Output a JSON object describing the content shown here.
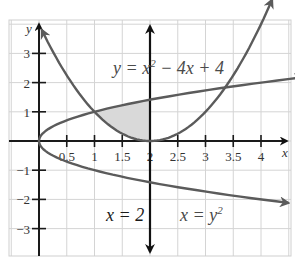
{
  "chart_data": {
    "type": "line",
    "title": "",
    "xlabel": "x",
    "ylabel": "y",
    "xlim": [
      -0.55,
      4.55
    ],
    "ylim": [
      -3.9,
      4.2
    ],
    "grid": true,
    "x_ticks": [
      0.5,
      1,
      1.5,
      2,
      2.5,
      3,
      3.5,
      4
    ],
    "x_tick_labels": [
      "0.5",
      "1",
      "1.5",
      "2",
      "2.5",
      "3",
      "3.5",
      "4"
    ],
    "y_ticks": [
      3,
      2,
      1,
      -1,
      -2,
      -3
    ],
    "y_tick_labels": [
      "3",
      "2",
      "1",
      "−1",
      "−2",
      "−3"
    ],
    "series": [
      {
        "name": "y = x^2 − 4x + 4",
        "kind": "function_of_x",
        "expression": "(x-2)^2",
        "x_range": [
          0,
          4.05
        ],
        "color": "#5b5b5b"
      },
      {
        "name": "x = y^2",
        "kind": "function_of_y",
        "expression": "y^2",
        "y_range": [
          -2.12,
          2.12
        ],
        "color": "#5b5b5b"
      },
      {
        "name": "x = 2",
        "kind": "vertical_line",
        "x": 2,
        "color": "#111111"
      }
    ],
    "shaded_region": {
      "x_from": 1,
      "x_to": 2,
      "upper": "sqrt(x)",
      "lower": "(x-2)^2",
      "color": "#d9d9d9"
    },
    "intersections": [
      [
        1,
        1
      ],
      [
        3.4,
        1.84
      ]
    ],
    "annotations": [
      {
        "text_prefix": "y = x",
        "sup": "2",
        "text_suffix": " − 4x + 4"
      },
      {
        "text": "x = 2"
      },
      {
        "text_prefix": "x = y",
        "sup": "2"
      }
    ]
  },
  "labels": {
    "x_axis": "x",
    "y_axis": "y",
    "ticks_x": [
      "0.5",
      "1",
      "1.5",
      "2",
      "2.5",
      "3",
      "3.5",
      "4"
    ],
    "ticks_y": [
      "3",
      "2",
      "1",
      "−1",
      "−2",
      "−3"
    ],
    "eq_parabola_prefix": "y = x",
    "eq_parabola_sup": "2",
    "eq_parabola_suffix": " − 4x + 4",
    "eq_vertical": "x = 2",
    "eq_sideways_prefix": "x = y",
    "eq_sideways_sup": "2"
  }
}
